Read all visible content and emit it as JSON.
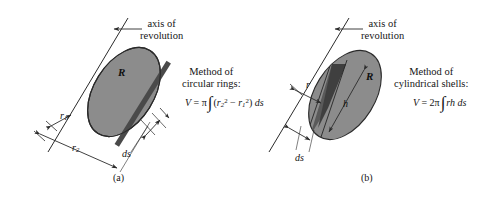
{
  "figure": {
    "background_color": "#ffffff",
    "ellipse_fill": "#8c8c8c",
    "ellipse_stroke": "#2a2a2a",
    "slice_fill": "#4a4a4a",
    "line_color": "#2b2b2b"
  },
  "panel_a": {
    "caption": "(a)",
    "axis_label_line1": "axis of",
    "axis_label_line2": "revolution",
    "method_line1": "Method of",
    "method_line2": "circular rings:",
    "region_label": "R",
    "formula": {
      "lhs": "V",
      "equals": "=",
      "coefficient": "π",
      "integral": "∫",
      "integrand_open": "(",
      "term1_base": "r",
      "term1_sub": "2",
      "term1_sup": "2",
      "minus": "−",
      "term2_base": "r",
      "term2_sub": "1",
      "term2_sup": "2",
      "integrand_close": ")",
      "differential": "ds",
      "plain": "V = π ∫ (r₂² − r₁²) ds"
    },
    "dim_labels": {
      "inner_radius_base": "r",
      "inner_radius_sub": "1",
      "outer_radius_base": "r",
      "outer_radius_sub": "2",
      "thickness": "ds"
    }
  },
  "panel_b": {
    "caption": "(b)",
    "axis_label_line1": "axis of",
    "axis_label_line2": "revolution",
    "method_line1": "Method of",
    "method_line2": "cylindrical shells:",
    "region_label": "R",
    "formula": {
      "lhs": "V",
      "equals": "=",
      "coefficient": "2π",
      "integral": "∫",
      "integrand": "rh",
      "differential": "ds",
      "plain": "V = 2π ∫ rh ds"
    },
    "dim_labels": {
      "shell_radius": "r",
      "shell_height": "h",
      "thickness": "ds"
    }
  }
}
